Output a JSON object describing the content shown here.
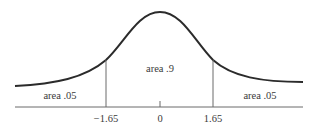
{
  "diagram": {
    "type": "normal-distribution",
    "regions": [
      {
        "id": "left-tail",
        "label": "area .05"
      },
      {
        "id": "center",
        "label": "area .9"
      },
      {
        "id": "right-tail",
        "label": "area .05"
      }
    ],
    "axis": {
      "ticks": [
        {
          "value": -1.65,
          "label": "−1.65"
        },
        {
          "value": 0,
          "label": "0"
        },
        {
          "value": 1.65,
          "label": "1.65"
        }
      ]
    },
    "colors": {
      "curve": "#2b2b2b",
      "lines": "#6a6a6a",
      "text": "#3a3a3a",
      "background": "#ffffff"
    }
  }
}
